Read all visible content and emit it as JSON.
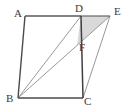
{
  "figure": {
    "type": "geometry-diagram",
    "shape": "parallelogram-with-shaded-triangle",
    "canvas": {
      "width": 129,
      "height": 112
    },
    "background_color": "#ffffff",
    "stroke_color_outline": "#4a4a4a",
    "stroke_color_inner": "#8a8a8a",
    "shaded_fill_color": "#d9d9d9",
    "label_color": "#3a3a3a",
    "points": {
      "A": {
        "x": 25,
        "y": 16,
        "label": "A",
        "label_x": 14,
        "label_y": 8
      },
      "D": {
        "x": 81,
        "y": 16,
        "label": "D",
        "label_x": 75,
        "label_y": 4
      },
      "E": {
        "x": 110,
        "y": 16,
        "label": "E",
        "label_x": 114,
        "label_y": 7
      },
      "F": {
        "x": 77,
        "y": 45,
        "label": "F",
        "label_x": 79,
        "label_y": 45
      },
      "B": {
        "x": 18,
        "y": 98,
        "label": "B",
        "label_x": 7,
        "label_y": 94
      },
      "C": {
        "x": 83,
        "y": 98,
        "label": "C",
        "label_x": 84,
        "label_y": 97
      }
    },
    "outline_edges": [
      {
        "name": "edge-AD",
        "from": "A",
        "to": "D"
      },
      {
        "name": "edge-DE",
        "from": "D",
        "to": "E"
      },
      {
        "name": "edge-AB",
        "from": "A",
        "to": "B"
      },
      {
        "name": "edge-BC",
        "from": "B",
        "to": "C"
      },
      {
        "name": "edge-DC",
        "from": "D",
        "to": "C"
      },
      {
        "name": "edge-CE",
        "from": "C",
        "to": "E"
      }
    ],
    "inner_segments": [
      {
        "name": "segment-BD",
        "from": "B",
        "to": "D"
      },
      {
        "name": "segment-BE",
        "from": "B",
        "to": "E"
      },
      {
        "name": "segment-DE-diagonal",
        "from": "D",
        "to": "E"
      }
    ],
    "shaded_region": {
      "name": "triangle-DEF",
      "vertices": [
        "D",
        "E",
        "F"
      ],
      "fill": "#d9d9d9"
    }
  },
  "labels": {
    "a": "A",
    "b": "B",
    "c": "C",
    "d": "D",
    "e": "E",
    "f": "F"
  }
}
